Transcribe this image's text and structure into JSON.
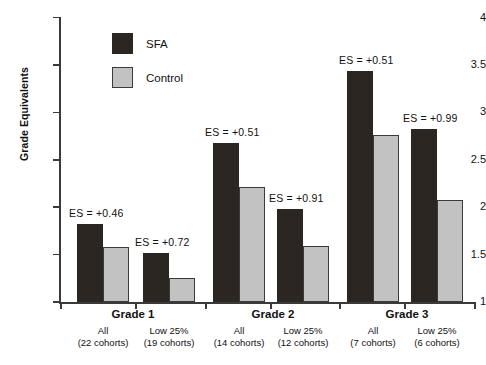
{
  "chart_data": {
    "type": "bar",
    "title": "",
    "xlabel": "",
    "ylabel": "Grade Equivalents",
    "ylim": [
      1,
      4
    ],
    "yticks": [
      1,
      1.5,
      2,
      2.5,
      3,
      3.5,
      4
    ],
    "ytick_labels": [
      "1",
      "1.5",
      "2",
      "2.5",
      "3",
      "3.5",
      "4"
    ],
    "grid": false,
    "legend_position": "upper-left-inside",
    "categories": [
      "Grade 1 / All (22 cohorts)",
      "Grade 1 / Low 25% (19 cohorts)",
      "Grade 2 / All (14 cohorts)",
      "Grade 2 / Low 25% (12 cohorts)",
      "Grade 3 / All (7 cohorts)",
      "Grade 3 / Low 25% (6 cohorts)"
    ],
    "series": [
      {
        "name": "SFA",
        "color": "#2b2622",
        "values": [
          1.82,
          1.52,
          2.68,
          1.98,
          3.44,
          2.82
        ]
      },
      {
        "name": "Control",
        "color": "#c2c2c2",
        "values": [
          1.58,
          1.25,
          2.21,
          1.59,
          2.76,
          2.08
        ]
      }
    ],
    "annotations": [
      {
        "text": "ES = +0.46",
        "group": 0
      },
      {
        "text": "ES = +0.72",
        "group": 1
      },
      {
        "text": "ES = +0.51",
        "group": 2
      },
      {
        "text": "ES = +0.91",
        "group": 3
      },
      {
        "text": "ES = +0.51",
        "group": 4
      },
      {
        "text": "ES = +0.99",
        "group": 5
      }
    ]
  },
  "legend": {
    "items": [
      {
        "label": "SFA",
        "color": "#2b2622"
      },
      {
        "label": "Control",
        "color": "#c2c2c2"
      }
    ]
  },
  "axis": {
    "ylabel": "Grade Equivalents",
    "ticks": [
      "4",
      "3.5",
      "3",
      "2.5",
      "2",
      "1.5",
      "1"
    ]
  },
  "groups": [
    {
      "title": "Grade 1",
      "bars": [
        {
          "sub": "All",
          "cohorts": "(22 cohorts)",
          "es": "ES = +0.46"
        },
        {
          "sub": "Low 25%",
          "cohorts": "(19 cohorts)",
          "es": "ES = +0.72"
        }
      ]
    },
    {
      "title": "Grade 2",
      "bars": [
        {
          "sub": "All",
          "cohorts": "(14 cohorts)",
          "es": "ES = +0.51"
        },
        {
          "sub": "Low 25%",
          "cohorts": "(12 cohorts)",
          "es": "ES = +0.91"
        }
      ]
    },
    {
      "title": "Grade 3",
      "bars": [
        {
          "sub": "All",
          "cohorts": "(7 cohorts)",
          "es": "ES = +0.51"
        },
        {
          "sub": "Low 25%",
          "cohorts": "(6 cohorts)",
          "es": "ES = +0.99"
        }
      ]
    }
  ]
}
